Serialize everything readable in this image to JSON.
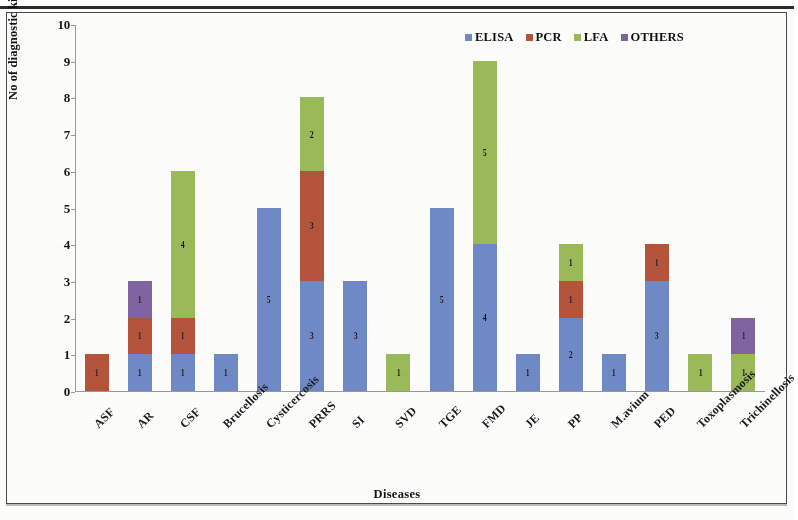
{
  "figure": {
    "background": "#fdfdfc",
    "frame_color": "#4a4a4a"
  },
  "legend": {
    "position": "top-right",
    "items": [
      {
        "label": "ELISA",
        "color": "#6f8ac6"
      },
      {
        "label": "PCR",
        "color": "#b5543a"
      },
      {
        "label": "LFA",
        "color": "#9bba58"
      },
      {
        "label": "OTHERS",
        "color": "#8064a2"
      }
    ]
  },
  "axes": {
    "y_title": "No of diagnostic kits",
    "x_title": "Diseases",
    "y_ticks": [
      "0",
      "1",
      "2",
      "3",
      "4",
      "5",
      "6",
      "7",
      "8",
      "9",
      "10"
    ]
  },
  "chart_data": {
    "type": "bar",
    "subtype": "stacked",
    "title": "",
    "xlabel": "Diseases",
    "ylabel": "No of diagnostic kits",
    "ylim": [
      0,
      10
    ],
    "ytick_step": 1,
    "grid": false,
    "legend_position": "top-right",
    "categories": [
      "ASF",
      "AR",
      "CSF",
      "Brucellosis",
      "Cysticercosis",
      "PRRS",
      "SI",
      "SVD",
      "TGE",
      "FMD",
      "JE",
      "PP",
      "M.avium",
      "PED",
      "Toxoplasmosis",
      "Trichinellosis"
    ],
    "series": [
      {
        "name": "ELISA",
        "color": "#6f8ac6",
        "values": [
          0,
          1,
          1,
          1,
          5,
          3,
          3,
          0,
          5,
          4,
          1,
          2,
          1,
          3,
          0,
          0
        ]
      },
      {
        "name": "PCR",
        "color": "#b5543a",
        "values": [
          1,
          1,
          1,
          0,
          0,
          3,
          0,
          0,
          0,
          0,
          0,
          1,
          0,
          1,
          0,
          0
        ]
      },
      {
        "name": "LFA",
        "color": "#9bba58",
        "values": [
          0,
          0,
          4,
          0,
          0,
          2,
          0,
          1,
          0,
          5,
          0,
          1,
          0,
          0,
          1,
          1
        ]
      },
      {
        "name": "OTHERS",
        "color": "#8064a2",
        "values": [
          0,
          1,
          0,
          0,
          0,
          0,
          0,
          0,
          0,
          0,
          0,
          0,
          0,
          0,
          0,
          1
        ]
      }
    ],
    "totals": [
      1,
      3,
      6,
      1,
      5,
      8,
      3,
      1,
      5,
      9,
      1,
      4,
      1,
      4,
      1,
      2
    ]
  }
}
